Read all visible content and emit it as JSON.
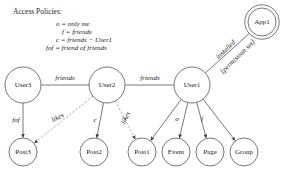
{
  "legend": {
    "title": "Access Policies:",
    "lines": [
      "o = only me",
      "f = friends",
      "c = friends − User1",
      "fof = friend of friends"
    ]
  },
  "nodes": [
    {
      "id": "app1",
      "label": "App1",
      "x": 262,
      "y": 22,
      "r": 14,
      "double": true
    },
    {
      "id": "user3",
      "label": "User3",
      "x": 23,
      "y": 85,
      "r": 18,
      "double": false
    },
    {
      "id": "user2",
      "label": "User2",
      "x": 107,
      "y": 85,
      "r": 18,
      "double": false
    },
    {
      "id": "user1",
      "label": "User1",
      "x": 192,
      "y": 85,
      "r": 18,
      "double": false
    },
    {
      "id": "post3",
      "label": "Post3",
      "x": 23,
      "y": 152,
      "r": 14,
      "double": false
    },
    {
      "id": "post2",
      "label": "Post2",
      "x": 94,
      "y": 152,
      "r": 14,
      "double": false
    },
    {
      "id": "post1",
      "label": "Post1",
      "x": 142,
      "y": 152,
      "r": 14,
      "double": false
    },
    {
      "id": "event",
      "label": "Event",
      "x": 176,
      "y": 152,
      "r": 14,
      "double": false
    },
    {
      "id": "page",
      "label": "Page",
      "x": 210,
      "y": 152,
      "r": 14,
      "double": false
    },
    {
      "id": "group",
      "label": "Group",
      "x": 244,
      "y": 152,
      "r": 14,
      "double": false
    }
  ],
  "edges": [
    {
      "id": "user3-user2",
      "from": "user3",
      "to": "user2",
      "label": "friends",
      "style": "solid",
      "arrow": false,
      "label_x": 65,
      "label_y": 78,
      "label_rot": 0
    },
    {
      "id": "user2-user1",
      "from": "user2",
      "to": "user1",
      "label": "friends",
      "style": "solid",
      "arrow": false,
      "label_x": 150,
      "label_y": 78,
      "label_rot": 0
    },
    {
      "id": "user1-app1",
      "from": "user1",
      "to": "app1",
      "label": "installed",
      "style": "solid",
      "arrow": false,
      "label_x": 226,
      "label_y": 50,
      "label_rot": -44
    },
    {
      "id": "user1-app1-perm",
      "from": "user1",
      "to": "app1",
      "label": "[permission set]",
      "style": "solid",
      "arrow": false,
      "label_x": 238,
      "label_y": 57,
      "label_rot": -44
    },
    {
      "id": "user3-post3",
      "from": "user3",
      "to": "post3",
      "label": "fof",
      "style": "solid",
      "arrow": true,
      "label_x": 16,
      "label_y": 120,
      "label_rot": 0
    },
    {
      "id": "user2-post3",
      "from": "user2",
      "to": "post3",
      "label": "likes",
      "style": "dashed",
      "arrow": true,
      "label_x": 58,
      "label_y": 118,
      "label_rot": -28
    },
    {
      "id": "user2-post2",
      "from": "user2",
      "to": "post2",
      "label": "c",
      "style": "solid",
      "arrow": true,
      "label_x": 95,
      "label_y": 120,
      "label_rot": 0
    },
    {
      "id": "user2-post1",
      "from": "user2",
      "to": "post1",
      "label": "likes",
      "style": "dashed",
      "arrow": true,
      "label_x": 126,
      "label_y": 118,
      "label_rot": -62
    },
    {
      "id": "user1-post1",
      "from": "user1",
      "to": "post1",
      "label": "",
      "style": "solid",
      "arrow": true,
      "label_x": 0,
      "label_y": 0,
      "label_rot": 0
    },
    {
      "id": "user1-event",
      "from": "user1",
      "to": "event",
      "label": "o",
      "style": "solid",
      "arrow": true,
      "label_x": 177,
      "label_y": 119,
      "label_rot": 0
    },
    {
      "id": "user1-page",
      "from": "user1",
      "to": "page",
      "label": "f",
      "style": "solid",
      "arrow": true,
      "label_x": 202,
      "label_y": 119,
      "label_rot": 0
    },
    {
      "id": "user1-group",
      "from": "user1",
      "to": "group",
      "label": "",
      "style": "solid",
      "arrow": true,
      "label_x": 0,
      "label_y": 0,
      "label_rot": 0
    }
  ],
  "colors": {
    "stroke": "#555555",
    "dashed_stroke": "#999999",
    "node_fill": "#ffffff",
    "text": "#1a1a1a",
    "background": "#ffffff"
  }
}
